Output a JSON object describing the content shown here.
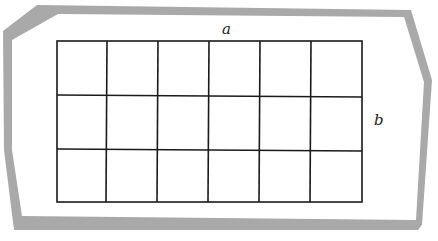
{
  "diagram": {
    "labels": {
      "top": "a",
      "right": "b"
    },
    "grid": {
      "columns": 6,
      "rows": 3,
      "line_color": "#1a1a1a"
    },
    "frame": {
      "color": "#a9a9a9"
    }
  }
}
